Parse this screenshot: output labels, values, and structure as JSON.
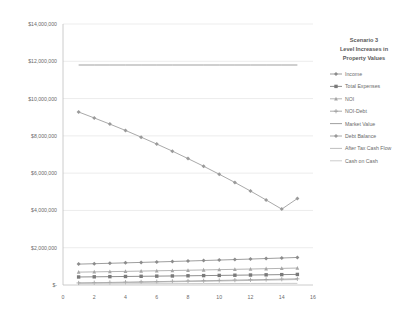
{
  "chart_data": {
    "type": "line",
    "title_lines": [
      "Scenario 3",
      "Level Increases in",
      "Property Values"
    ],
    "xlabel": "",
    "ylabel": "",
    "xlim": [
      0,
      16
    ],
    "ylim": [
      0,
      14000000
    ],
    "grid": true,
    "legend_position": "right",
    "x_ticks": [
      0,
      2,
      4,
      6,
      8,
      10,
      12,
      14,
      16
    ],
    "x_tick_labels": [
      "0",
      "2",
      "4",
      "6",
      "8",
      "10",
      "12",
      "14",
      "16"
    ],
    "y_ticks": [
      0,
      2000000,
      4000000,
      6000000,
      8000000,
      10000000,
      12000000,
      14000000
    ],
    "y_tick_labels": [
      "$-",
      "$2,000,000",
      "$4,000,000",
      "$6,000,000",
      "$8,000,000",
      "$10,000,000",
      "$12,000,000",
      "$14,000,000"
    ],
    "x": [
      1,
      2,
      3,
      4,
      5,
      6,
      7,
      8,
      9,
      10,
      11,
      12,
      13,
      14,
      15
    ],
    "series": [
      {
        "name": "Income",
        "color": "#8c8c8c",
        "marker": "diamond",
        "values": [
          1120000,
          1142000,
          1165000,
          1188000,
          1212000,
          1236000,
          1261000,
          1286000,
          1312000,
          1338000,
          1365000,
          1392000,
          1420000,
          1448000,
          1477000
        ]
      },
      {
        "name": "Total Expenses",
        "color": "#7a7a7a",
        "marker": "square",
        "values": [
          430000,
          439000,
          448000,
          457000,
          466000,
          475000,
          485000,
          494000,
          504000,
          514000,
          525000,
          535000,
          546000,
          557000,
          568000
        ]
      },
      {
        "name": "NOI",
        "color": "#a6a6a6",
        "marker": "triangle",
        "values": [
          690000,
          703000,
          717000,
          731000,
          746000,
          761000,
          776000,
          792000,
          808000,
          824000,
          840000,
          857000,
          874000,
          891000,
          909000
        ]
      },
      {
        "name": "NOI-Debt",
        "color": "#9c9c9c",
        "marker": "cross",
        "values": [
          110000,
          123000,
          137000,
          151000,
          166000,
          181000,
          196000,
          212000,
          228000,
          244000,
          260000,
          277000,
          294000,
          311000,
          329000
        ]
      },
      {
        "name": "Market Value",
        "color": "#8f8f8f",
        "marker": "none",
        "values": [
          11800000,
          11800000,
          11800000,
          11800000,
          11800000,
          11800000,
          11800000,
          11800000,
          11800000,
          11800000,
          11800000,
          11800000,
          11800000,
          11800000,
          11800000
        ]
      },
      {
        "name": "Debt Balance",
        "color": "#9a9a9a",
        "marker": "diamond",
        "values": [
          9280000,
          8960000,
          8630000,
          8290000,
          7930000,
          7560000,
          7180000,
          6780000,
          6370000,
          5940000,
          5500000,
          5040000,
          4560000,
          4070000,
          4640000
        ]
      },
      {
        "name": "After Tax Cash Flow",
        "color": "#b3b3b3",
        "marker": "none",
        "values": [
          95000,
          107000,
          119000,
          132000,
          145000,
          158000,
          172000,
          186000,
          200000,
          215000,
          230000,
          245000,
          261000,
          277000,
          293000
        ]
      },
      {
        "name": "Cash on Cash",
        "color": "#c2c2c2",
        "marker": "none",
        "values": [
          60000,
          62000,
          64000,
          66000,
          68000,
          70000,
          72000,
          74000,
          76000,
          78000,
          80000,
          82000,
          84000,
          86000,
          88000
        ]
      }
    ]
  },
  "legend": {
    "items": [
      {
        "label": "Income"
      },
      {
        "label": "Total Expenses"
      },
      {
        "label": "NOI"
      },
      {
        "label": "NOI-Debt"
      },
      {
        "label": "Market Value"
      },
      {
        "label": "Debt Balance"
      },
      {
        "label": "After Tax Cash Flow"
      },
      {
        "label": "Cash on Cash"
      }
    ]
  }
}
